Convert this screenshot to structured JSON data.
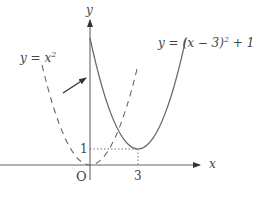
{
  "diagram": {
    "axes": {
      "x_label": "x",
      "y_label": "y",
      "origin_label": "O"
    },
    "ticks": {
      "x_tick": "3",
      "y_tick": "1"
    },
    "curves": [
      {
        "name": "shifted-parabola",
        "label_text": "y = (x − 3)",
        "label_exp": "2",
        "label_tail": " + 1",
        "style": "solid"
      },
      {
        "name": "base-parabola",
        "label_text": "y = x",
        "label_exp": "2",
        "style": "dashed"
      }
    ],
    "arrow": {
      "description": "translation arrow from y = x² to y = (x − 3)² + 1"
    },
    "colors": {
      "line": "#555555",
      "text": "#444444",
      "background": "#ffffff"
    }
  }
}
